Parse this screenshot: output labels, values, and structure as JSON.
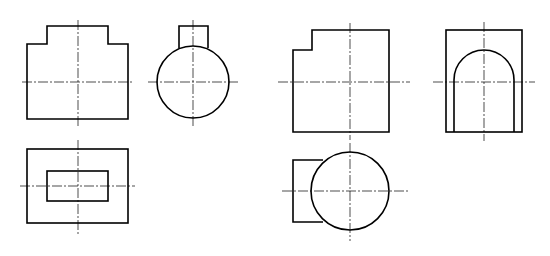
{
  "figure": {
    "type": "orthographic-projection-drawing",
    "colors": {
      "background": "#ffffff",
      "line": "#000000"
    },
    "groups": [
      {
        "id": "part-a",
        "views": [
          {
            "name": "front-view",
            "shape": "stepped-rectangle",
            "outline": "27,119 27,44 47,44 47,26 108,26 108,44 128,44 128,119",
            "center": [
              78,
              82
            ],
            "center_h": [
              22,
              134
            ],
            "center_v": [
              20,
              126
            ]
          },
          {
            "name": "side-view",
            "shape": "circle-with-boss",
            "circle": {
              "cx": 193,
              "cy": 82,
              "r": 36
            },
            "boss": "179,48 179,26 208,26 208,48",
            "center_h": [
              148,
              240
            ],
            "center_v": [
              20,
              126
            ]
          },
          {
            "name": "top-view",
            "shape": "nested-rectangles",
            "outer": {
              "x": 27,
              "y": 149,
              "w": 101,
              "h": 74
            },
            "inner": {
              "x": 47,
              "y": 171,
              "w": 61,
              "h": 30
            },
            "center": [
              78,
              186
            ],
            "center_h": [
              20,
              135
            ],
            "center_v": [
              140,
              234
            ]
          }
        ]
      },
      {
        "id": "part-b",
        "views": [
          {
            "name": "front-view",
            "shape": "notched-rectangle",
            "outline": "293,132 293,50 312,50 312,30 389,30 389,132",
            "center": [
              350,
              82
            ],
            "center_h": [
              278,
              410
            ],
            "center_v": [
              23,
              140
            ]
          },
          {
            "name": "side-view",
            "shape": "rectangle-with-arch-slot",
            "outer": {
              "x": 446,
              "y": 30,
              "w": 76,
              "h": 102
            },
            "arch": "M454,132 L454,80 A30,30 0 0 1 514,80 L514,132",
            "center": [
              484,
              82
            ],
            "center_h": [
              433,
              535
            ],
            "center_v": [
              22,
              141
            ]
          },
          {
            "name": "top-view",
            "shape": "circle-with-rectangle",
            "circle": {
              "cx": 350,
              "cy": 191,
              "r": 39
            },
            "rect": "323,160 293,160 293,222 323,222",
            "center_h": [
              282,
              410
            ],
            "center_v": [
              143,
              241
            ]
          }
        ]
      }
    ]
  }
}
